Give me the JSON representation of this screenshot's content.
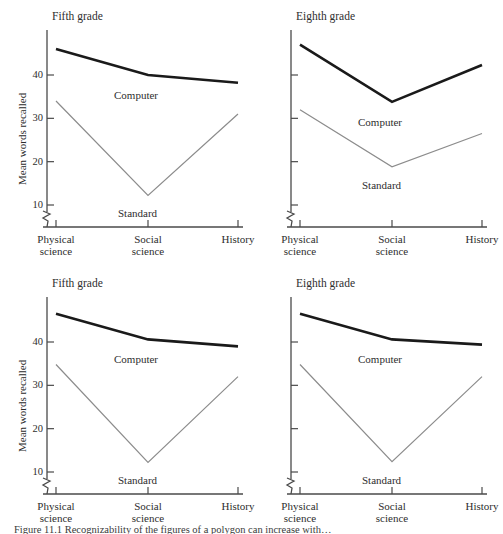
{
  "figure": {
    "caption": "Figure 11.1  Recognizability of the figures of a polygon can increase with…",
    "axis_label_y": "Mean words recalled",
    "colors": {
      "computer_line": "#1a1a1a",
      "standard_line": "#8c8c8c",
      "axis": "#4a4a4a",
      "text": "#2e2e2e",
      "background": "#ffffff"
    }
  },
  "chart_data": [
    {
      "id": "top-left",
      "type": "line",
      "title": "Fifth grade",
      "xlabel": "",
      "ylabel": "Mean words recalled",
      "categories": [
        "Physical science",
        "Social science",
        "History"
      ],
      "yticks": [
        10,
        20,
        30,
        40
      ],
      "ytick_labels": [
        "10",
        "20",
        "30",
        "40"
      ],
      "ylim": [
        7,
        50
      ],
      "axis_break": true,
      "grid": false,
      "legend": "inline-annotations",
      "series": [
        {
          "name": "Computer",
          "values": [
            46.0,
            40.0,
            38.2
          ],
          "color": "#1a1a1a",
          "width": 2.6
        },
        {
          "name": "Standard",
          "values": [
            34.0,
            12.2,
            31.0
          ],
          "color": "#8c8c8c",
          "width": 1.2
        }
      ]
    },
    {
      "id": "top-right",
      "type": "line",
      "title": "Eighth grade",
      "xlabel": "",
      "ylabel": "",
      "categories": [
        "Physical science",
        "Social science",
        "History"
      ],
      "yticks": [
        10,
        20,
        30,
        40
      ],
      "ytick_labels": [
        "",
        "",
        "",
        ""
      ],
      "ylim": [
        7,
        50
      ],
      "axis_break": true,
      "grid": false,
      "legend": "inline-annotations",
      "series": [
        {
          "name": "Computer",
          "values": [
            47.0,
            33.8,
            42.3
          ],
          "color": "#1a1a1a",
          "width": 2.6
        },
        {
          "name": "Standard",
          "values": [
            32.0,
            18.8,
            26.5
          ],
          "color": "#8c8c8c",
          "width": 1.2
        }
      ]
    },
    {
      "id": "bottom-left",
      "type": "line",
      "title": "Fifth grade",
      "xlabel": "",
      "ylabel": "Mean words recalled",
      "categories": [
        "Physical science",
        "Social science",
        "History"
      ],
      "yticks": [
        10,
        20,
        30,
        40
      ],
      "ytick_labels": [
        "10",
        "20",
        "30",
        "40"
      ],
      "ylim": [
        7,
        50
      ],
      "axis_break": true,
      "grid": false,
      "legend": "inline-annotations",
      "series": [
        {
          "name": "Computer",
          "values": [
            46.5,
            40.6,
            39.0
          ],
          "color": "#1a1a1a",
          "width": 2.6
        },
        {
          "name": "Standard",
          "values": [
            34.8,
            12.2,
            32.0
          ],
          "color": "#8c8c8c",
          "width": 1.2
        }
      ]
    },
    {
      "id": "bottom-right",
      "type": "line",
      "title": "Eighth grade",
      "xlabel": "",
      "ylabel": "",
      "categories": [
        "Physical science",
        "Social science",
        "History"
      ],
      "yticks": [
        10,
        20,
        30,
        40
      ],
      "ytick_labels": [
        "",
        "",
        "",
        ""
      ],
      "ylim": [
        7,
        50
      ],
      "axis_break": true,
      "grid": false,
      "legend": "inline-annotations",
      "series": [
        {
          "name": "Computer",
          "values": [
            46.5,
            40.6,
            39.4
          ],
          "color": "#1a1a1a",
          "width": 2.6
        },
        {
          "name": "Standard",
          "values": [
            34.8,
            12.4,
            32.0
          ],
          "color": "#8c8c8c",
          "width": 1.2
        }
      ]
    }
  ]
}
